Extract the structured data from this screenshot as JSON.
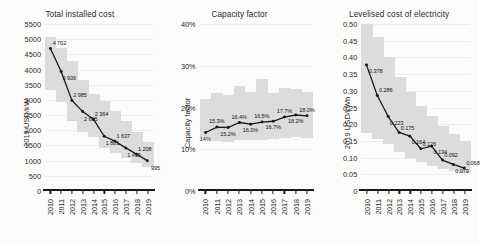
{
  "figure": {
    "background": "#fbfbfa",
    "band_color": "#dcdcdc",
    "line_color": "#1a1a1a",
    "grid_color": "#ededed"
  },
  "chart_data": [
    {
      "type": "line",
      "title": "Total installed cost",
      "ylabel": "2019 USD/kW",
      "xlabel": "",
      "categories": [
        "2010",
        "2011",
        "2012",
        "2013",
        "2014",
        "2015",
        "2016",
        "2017",
        "2018",
        "2019"
      ],
      "values": [
        4702,
        3936,
        2985,
        2615,
        2364,
        1801,
        1637,
        1415,
        1208,
        995
      ],
      "value_labels": [
        "4 702",
        "3 936",
        "2 985",
        "2 615",
        "2 364",
        "1 801",
        "1 637",
        "1 415",
        "1 208",
        "995"
      ],
      "ylim": [
        0,
        5500
      ],
      "yticks": [
        0,
        500,
        1000,
        1500,
        2000,
        2500,
        3000,
        3500,
        4000,
        4500,
        5000,
        5500
      ],
      "ytick_labels": [
        "0",
        "500",
        "1000",
        "1500",
        "2000",
        "2500",
        "3000",
        "3500",
        "4000",
        "4500",
        "5000",
        "5500"
      ],
      "band_low": [
        3330,
        2930,
        2310,
        1940,
        1790,
        1430,
        1260,
        1080,
        930,
        800
      ],
      "band_high": [
        5080,
        4720,
        4290,
        3660,
        3180,
        2960,
        2620,
        2300,
        1950,
        1620
      ],
      "grid": true,
      "legend": "none"
    },
    {
      "type": "line",
      "title": "Capacity factor",
      "ylabel": "Capacity factor",
      "xlabel": "",
      "categories": [
        "2010",
        "2011",
        "2012",
        "2013",
        "2014",
        "2015",
        "2016",
        "2017",
        "2018",
        "2019"
      ],
      "values": [
        14.0,
        15.3,
        15.2,
        16.4,
        16.0,
        16.5,
        16.7,
        17.7,
        18.2,
        18.0
      ],
      "value_labels": [
        "14%",
        "15.3%",
        "15.2%",
        "16.4%",
        "16.0%",
        "16.5%",
        "16.7%",
        "17.7%",
        "18.2%",
        "18.0%"
      ],
      "ylim": [
        0,
        40
      ],
      "yticks": [
        0,
        10,
        20,
        30,
        40
      ],
      "ytick_labels": [
        "0%",
        "10%",
        "20%",
        "30%",
        "40%"
      ],
      "band_low": [
        12.6,
        11.9,
        11.7,
        12.1,
        12.2,
        12.3,
        12.4,
        12.6,
        12.9,
        12.8
      ],
      "band_high": [
        22.0,
        23.4,
        23.0,
        25.2,
        23.6,
        26.8,
        23.4,
        24.6,
        24.5,
        23.8
      ],
      "grid": true,
      "legend": "none"
    },
    {
      "type": "line",
      "title": "Levelised cost of electricity",
      "ylabel": "2019 USD/kWh",
      "xlabel": "",
      "categories": [
        "2010",
        "2011",
        "2012",
        "2013",
        "2014",
        "2015",
        "2016",
        "2017",
        "2018",
        "2019"
      ],
      "values": [
        0.378,
        0.286,
        0.223,
        0.175,
        0.164,
        0.126,
        0.134,
        0.092,
        0.079,
        0.068
      ],
      "value_labels": [
        "0.378",
        "0.286",
        "0.223",
        "0.175",
        "0.164",
        "0.126",
        "0.134",
        "0.092",
        "0.079",
        "0.068"
      ],
      "ylim": [
        0,
        0.5
      ],
      "yticks": [
        0,
        0.05,
        0.1,
        0.15,
        0.2,
        0.25,
        0.3,
        0.35,
        0.4,
        0.45,
        0.5
      ],
      "ytick_labels": [
        "0",
        "0.05",
        "0.10",
        "0.15",
        "0.20",
        "0.25",
        "0.30",
        "0.35",
        "0.40",
        "0.45",
        "0.50"
      ],
      "band_low": [
        0.175,
        0.155,
        0.14,
        0.118,
        0.1,
        0.086,
        0.076,
        0.066,
        0.06,
        0.055
      ],
      "band_high": [
        0.5,
        0.46,
        0.4,
        0.34,
        0.295,
        0.255,
        0.225,
        0.196,
        0.172,
        0.15
      ],
      "grid": true,
      "legend": "none"
    }
  ]
}
